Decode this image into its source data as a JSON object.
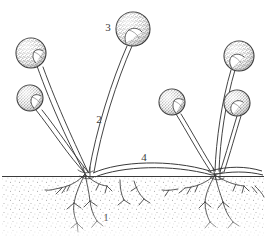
{
  "figure": {
    "style": "black-and-white stippled line drawing",
    "background_color": "#ffffff",
    "ink_color": "#3a3a3a",
    "substrate_color": "#fbfbfb",
    "width": 266,
    "height": 250
  },
  "labels": [
    {
      "id": "label-1",
      "text": "1",
      "refers_to": "rhizoids",
      "x": 106,
      "y": 221
    },
    {
      "id": "label-2",
      "text": "2",
      "refers_to": "sporangiophore",
      "x": 97,
      "y": 123
    },
    {
      "id": "label-3",
      "text": "3",
      "refers_to": "sporangium",
      "x": 105,
      "y": 31
    },
    {
      "id": "label-4",
      "text": "4",
      "refers_to": "stolon",
      "x": 140,
      "y": 161
    }
  ],
  "ground": {
    "name": "substrate-line",
    "surface_y": 176,
    "bottom_y": 236,
    "stipple": true
  },
  "clusters": [
    {
      "name": "left-colony",
      "node_x": 85,
      "node_y": 172,
      "sporangia": [
        {
          "cx": 31,
          "cy": 53,
          "r": 15
        },
        {
          "cx": 30,
          "cy": 98,
          "r": 13
        },
        {
          "cx": 133,
          "cy": 29,
          "r": 17
        }
      ]
    },
    {
      "name": "right-colony",
      "node_x": 215,
      "node_y": 173,
      "sporangia": [
        {
          "cx": 172,
          "cy": 102,
          "r": 13
        },
        {
          "cx": 239,
          "cy": 56,
          "r": 15
        },
        {
          "cx": 237,
          "cy": 103,
          "r": 13
        }
      ]
    }
  ]
}
